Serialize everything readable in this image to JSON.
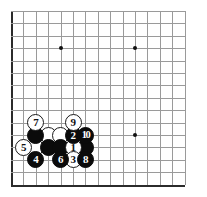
{
  "app": {
    "title": "Go board diagram",
    "description": "19x19 Go board corner diagram showing a numbered joseki sequence in the lower left corner"
  },
  "board": {
    "background_color": "#ffffff",
    "line_color": "#9a9a9a",
    "edge_color": "#2b2b2b",
    "star_point_color": "#111111",
    "columns": 15,
    "rows": 15,
    "spacing_px": 12.4,
    "origin_x": 11,
    "origin_y": 11,
    "star_points": [
      {
        "col": 4,
        "row": 3
      },
      {
        "col": 10,
        "row": 3
      },
      {
        "col": 10,
        "row": 10
      }
    ]
  },
  "stones": [
    {
      "id": "w-unnumbered-a",
      "color": "white",
      "label": "",
      "col": 3,
      "row": 10
    },
    {
      "id": "w-unnumbered-b",
      "color": "white",
      "label": "",
      "col": 4,
      "row": 10
    },
    {
      "id": "w-unnumbered-c",
      "color": "white",
      "label": "",
      "col": 2,
      "row": 11
    },
    {
      "id": "b-unnumbered-d",
      "color": "black",
      "label": "",
      "col": 2,
      "row": 10
    },
    {
      "id": "b-unnumbered-e",
      "color": "black",
      "label": "",
      "col": 3,
      "row": 11
    },
    {
      "id": "b-unnumbered-f",
      "color": "black",
      "label": "",
      "col": 4,
      "row": 11
    },
    {
      "id": "b-unnumbered-g",
      "color": "black",
      "label": "",
      "col": 6,
      "row": 11
    },
    {
      "id": "move-1",
      "color": "white",
      "label": "1",
      "col": 5,
      "row": 11
    },
    {
      "id": "move-2",
      "color": "black",
      "label": "2",
      "col": 5,
      "row": 10
    },
    {
      "id": "move-3",
      "color": "white",
      "label": "3",
      "col": 5,
      "row": 12
    },
    {
      "id": "move-4",
      "color": "black",
      "label": "4",
      "col": 2,
      "row": 12
    },
    {
      "id": "move-5",
      "color": "white",
      "label": "5",
      "col": 1,
      "row": 11
    },
    {
      "id": "move-6",
      "color": "black",
      "label": "6",
      "col": 4,
      "row": 12
    },
    {
      "id": "move-7",
      "color": "white",
      "label": "7",
      "col": 2,
      "row": 9
    },
    {
      "id": "move-8",
      "color": "black",
      "label": "8",
      "col": 6,
      "row": 12
    },
    {
      "id": "move-9",
      "color": "white",
      "label": "9",
      "col": 5,
      "row": 9
    },
    {
      "id": "move-10",
      "color": "black",
      "label": "10",
      "col": 6,
      "row": 10
    }
  ]
}
